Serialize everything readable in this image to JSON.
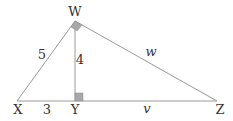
{
  "diagram": {
    "type": "right-triangle-with-altitude",
    "vertices": {
      "W": {
        "label": "W",
        "x": 75,
        "y": 21
      },
      "X": {
        "label": "X",
        "x": 17,
        "y": 101
      },
      "Y": {
        "label": "Y",
        "x": 75,
        "y": 101
      },
      "Z": {
        "label": "Z",
        "x": 217,
        "y": 101
      }
    },
    "edges": {
      "WX": {
        "label": "5"
      },
      "WY": {
        "label": "4"
      },
      "XY": {
        "label": "3"
      },
      "YZ": {
        "label": "v"
      },
      "WZ": {
        "label": "w"
      }
    },
    "right_angles": [
      "W",
      "Y"
    ],
    "colors": {
      "line": "#9a9a9a",
      "marker_fill": "#a8a8a8",
      "text": "#333333"
    }
  }
}
